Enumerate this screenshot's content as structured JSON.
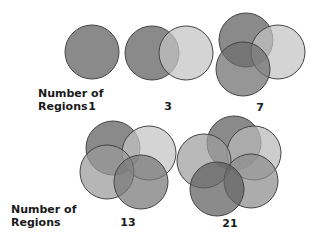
{
  "rows": [
    {
      "label_line1": "Number of",
      "label_line2": "Regions",
      "groups": [
        {
          "count": "1",
          "circles": [
            {
              "cx": 92,
              "cy": 52,
              "r": 27,
              "fill": "#8a8a8a"
            }
          ]
        },
        {
          "count": "3",
          "circles": [
            {
              "cx": 152,
              "cy": 53,
              "r": 27,
              "fill": "#8a8a8a"
            },
            {
              "cx": 186,
              "cy": 53,
              "r": 27,
              "fill": "#c4c4c4"
            }
          ]
        },
        {
          "count": "7",
          "circles": [
            {
              "cx": 246,
              "cy": 40,
              "r": 27,
              "fill": "#8a8a8a"
            },
            {
              "cx": 278,
              "cy": 52,
              "r": 27,
              "fill": "#c4c4c4"
            },
            {
              "cx": 243,
              "cy": 69,
              "r": 27,
              "fill": "#6e6e6e"
            }
          ]
        }
      ]
    },
    {
      "label_line1": "Number of",
      "label_line2": "Regions",
      "groups": [
        {
          "count": "13",
          "circles": [
            {
              "cx": 113,
              "cy": 148,
              "r": 27,
              "fill": "#8a8a8a"
            },
            {
              "cx": 149,
              "cy": 153,
              "r": 27,
              "fill": "#c4c4c4"
            },
            {
              "cx": 107,
              "cy": 172,
              "r": 27,
              "fill": "#9a9a9a"
            },
            {
              "cx": 141,
              "cy": 182,
              "r": 27,
              "fill": "#777777"
            }
          ]
        },
        {
          "count": "21",
          "circles": [
            {
              "cx": 234,
              "cy": 143,
              "r": 27,
              "fill": "#8a8a8a"
            },
            {
              "cx": 254,
              "cy": 153,
              "r": 27,
              "fill": "#b8b8b8"
            },
            {
              "cx": 204,
              "cy": 161,
              "r": 27,
              "fill": "#9e9e9e"
            },
            {
              "cx": 251,
              "cy": 181,
              "r": 27,
              "fill": "#8c8c8c"
            },
            {
              "cx": 217,
              "cy": 189,
              "r": 27,
              "fill": "#5e5e5e"
            }
          ]
        }
      ]
    }
  ],
  "colors": {
    "stroke": "#444444",
    "text": "#1a1a1a",
    "background": "#ffffff"
  }
}
